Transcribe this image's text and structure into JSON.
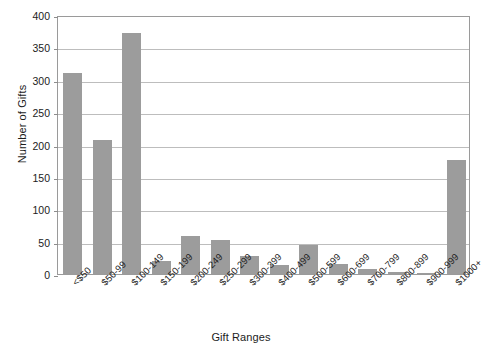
{
  "chart_data": {
    "type": "bar",
    "title": "",
    "xlabel": "Gift Ranges",
    "ylabel": "Number of Gifts",
    "ylim": [
      0,
      400
    ],
    "yticks": [
      0,
      50,
      100,
      150,
      200,
      250,
      300,
      350,
      400
    ],
    "grid": true,
    "legend": null,
    "bar_color": "#9c9c9c",
    "categories": [
      "<$50",
      "$50-99",
      "$100-149",
      "$150-199",
      "$200-249",
      "$250-299",
      "$300-399",
      "$400-499",
      "$500-599",
      "$600-699",
      "$700-799",
      "$800-899",
      "$900-999",
      "$1000+"
    ],
    "values": [
      310,
      207,
      372,
      20,
      58,
      53,
      28,
      14,
      45,
      15,
      8,
      3,
      2,
      176
    ]
  }
}
